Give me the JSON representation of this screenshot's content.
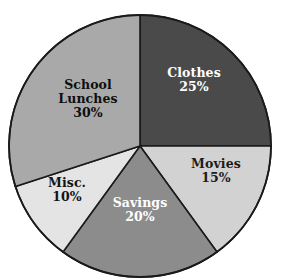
{
  "chart_data": {
    "type": "pie",
    "title": "",
    "subtitle": "",
    "xlabel": "",
    "ylabel": "",
    "legend_position": "none",
    "grid": false,
    "units": "percent",
    "start_angle_deg": 0,
    "direction": "clockwise",
    "categories": [
      "Clothes",
      "Movies",
      "Savings",
      "Misc.",
      "School Lunches"
    ],
    "values": [
      25,
      15,
      20,
      10,
      30
    ],
    "slices": [
      {
        "name": "Clothes",
        "label_line1": "Clothes",
        "label_line2": "",
        "value": 25,
        "value_label": "25%",
        "color": "#4a4a4a",
        "text_color": "#ffffff",
        "start_angle_deg": 0,
        "end_angle_deg": 90
      },
      {
        "name": "Movies",
        "label_line1": "Movies",
        "label_line2": "",
        "value": 15,
        "value_label": "15%",
        "color": "#d2d2d2",
        "text_color": "#1c1c1c",
        "start_angle_deg": 90,
        "end_angle_deg": 144
      },
      {
        "name": "Savings",
        "label_line1": "Savings",
        "label_line2": "",
        "value": 20,
        "value_label": "20%",
        "color": "#8c8c8c",
        "text_color": "#ffffff",
        "start_angle_deg": 144,
        "end_angle_deg": 216
      },
      {
        "name": "Misc.",
        "label_line1": "Misc.",
        "label_line2": "",
        "value": 10,
        "value_label": "10%",
        "color": "#e4e4e4",
        "text_color": "#141414",
        "start_angle_deg": 216,
        "end_angle_deg": 252
      },
      {
        "name": "School Lunches",
        "label_line1": "School",
        "label_line2": "Lunches",
        "value": 30,
        "value_label": "30%",
        "color": "#a9a9a9",
        "text_color": "#0f0f0f",
        "start_angle_deg": 252,
        "end_angle_deg": 360
      }
    ],
    "geometry": {
      "center_x": 140,
      "center_y": 146,
      "radius": 131,
      "outline_color": "#1a1a1a",
      "background": "#ffffff"
    }
  }
}
